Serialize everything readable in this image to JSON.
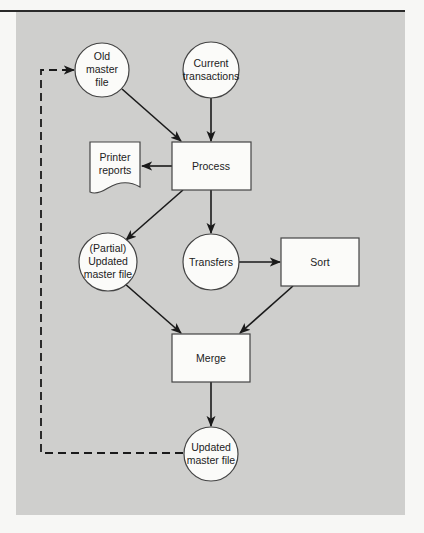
{
  "diagram": {
    "type": "flowchart",
    "colors": {
      "panel_background": "#cfcfcd",
      "page_background": "#f7f7f5",
      "node_fill": "#fbfbf9",
      "node_stroke": "#444444",
      "edge": "#1a1a1a"
    },
    "nodes": {
      "old_master": {
        "shape": "circle",
        "lines": [
          "Old",
          "master",
          "file"
        ]
      },
      "current_transactions": {
        "shape": "circle",
        "lines": [
          "Current",
          "transactions"
        ]
      },
      "process": {
        "shape": "rectangle",
        "lines": [
          "Process"
        ]
      },
      "printer_reports": {
        "shape": "document",
        "lines": [
          "Printer",
          "reports"
        ]
      },
      "partial_updated": {
        "shape": "circle",
        "lines": [
          "(Partial)",
          "Updated",
          "master file"
        ]
      },
      "transfers": {
        "shape": "circle",
        "lines": [
          "Transfers"
        ]
      },
      "sort": {
        "shape": "rectangle",
        "lines": [
          "Sort"
        ]
      },
      "merge": {
        "shape": "rectangle",
        "lines": [
          "Merge"
        ]
      },
      "updated_master": {
        "shape": "circle",
        "lines": [
          "Updated",
          "master file"
        ]
      }
    },
    "edges": [
      {
        "from": "Old master file",
        "to": "Process",
        "style": "solid"
      },
      {
        "from": "Current transactions",
        "to": "Process",
        "style": "solid"
      },
      {
        "from": "Process",
        "to": "Printer reports",
        "style": "solid"
      },
      {
        "from": "Process",
        "to": "(Partial) Updated master file",
        "style": "solid"
      },
      {
        "from": "Process",
        "to": "Transfers",
        "style": "solid"
      },
      {
        "from": "Transfers",
        "to": "Sort",
        "style": "solid"
      },
      {
        "from": "(Partial) Updated master file",
        "to": "Merge",
        "style": "solid"
      },
      {
        "from": "Sort",
        "to": "Merge",
        "style": "solid"
      },
      {
        "from": "Merge",
        "to": "Updated master file",
        "style": "solid"
      },
      {
        "from": "Updated master file",
        "to": "Old master file",
        "style": "dashed"
      }
    ]
  }
}
